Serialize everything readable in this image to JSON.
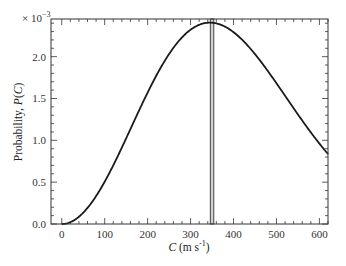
{
  "chart_data": {
    "type": "line",
    "title": "",
    "xlabel": "C (m s^-1)",
    "xlabel_parts": {
      "var": "C",
      "unit_open": " (m s",
      "exp": "-1",
      "unit_close": ")"
    },
    "ylabel": "Probability, P(C)",
    "ylabel_parts": {
      "prefix": "Probability, ",
      "var": "P",
      "arg_open": "(",
      "arg": "C",
      "arg_close": ")"
    },
    "y_multiplier": "×10^-3",
    "y_multiplier_parts": {
      "base": "× 10",
      "exp": "−3"
    },
    "xlim": [
      -25,
      620
    ],
    "ylim": [
      0.0,
      2.45
    ],
    "x_ticks": [
      0,
      100,
      200,
      300,
      400,
      500,
      600
    ],
    "x_tick_labels": [
      "0",
      "100",
      "200",
      "300",
      "400",
      "500",
      "600"
    ],
    "y_ticks": [
      0.0,
      0.5,
      1.0,
      1.5,
      2.0
    ],
    "y_tick_labels": [
      "0.0",
      "0.5",
      "1.0",
      "1.5",
      "2.0"
    ],
    "grid": false,
    "legend": null,
    "series": [
      {
        "name": "Maxwell-Boltzmann speed distribution",
        "x": [
          0,
          50,
          100,
          150,
          200,
          250,
          300,
          350,
          400,
          450,
          500,
          550,
          600,
          620
        ],
        "values": [
          0.0,
          0.13,
          0.48,
          0.95,
          1.48,
          1.95,
          2.28,
          2.39,
          2.27,
          1.98,
          1.6,
          1.2,
          0.85,
          0.93
        ]
      }
    ],
    "annotations": [
      {
        "type": "vertical-bar",
        "x_center": 350,
        "width": 8,
        "label": "most probable speed band"
      }
    ],
    "curve_params": {
      "most_probable_speed": 345
    }
  },
  "colors": {
    "curve": "#1a1a1a",
    "axes": "#333333",
    "bar_fill": "#d0d0d0",
    "bar_stroke": "#444444"
  }
}
